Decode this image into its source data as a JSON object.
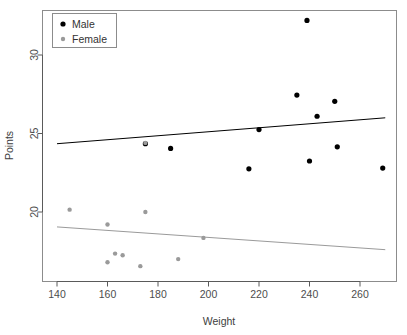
{
  "chart_data": {
    "type": "scatter",
    "title": "",
    "xlabel": "Weight",
    "ylabel": "Points",
    "xlim": [
      138,
      272
    ],
    "ylim": [
      16.1,
      32.6
    ],
    "xticks": [
      140,
      160,
      180,
      200,
      220,
      240,
      260
    ],
    "yticks": [
      20,
      25,
      30
    ],
    "grid": false,
    "legend_position": "top-left",
    "series": [
      {
        "name": "Male",
        "color": "#000000",
        "marker": "filled-circle",
        "points": [
          {
            "x": 175,
            "y": 24.35
          },
          {
            "x": 185,
            "y": 24.05
          },
          {
            "x": 216,
            "y": 22.75
          },
          {
            "x": 220,
            "y": 25.25
          },
          {
            "x": 235,
            "y": 27.45
          },
          {
            "x": 239,
            "y": 32.2
          },
          {
            "x": 240,
            "y": 23.25
          },
          {
            "x": 243,
            "y": 26.1
          },
          {
            "x": 250,
            "y": 27.05
          },
          {
            "x": 251,
            "y": 24.15
          },
          {
            "x": 269,
            "y": 22.8
          }
        ],
        "fit_line": {
          "x1": 140,
          "y1": 24.35,
          "x2": 270,
          "y2": 26.0
        }
      },
      {
        "name": "Female",
        "color": "#9a9a9a",
        "marker": "filled-circle",
        "points": [
          {
            "x": 145,
            "y": 20.15
          },
          {
            "x": 160,
            "y": 19.2
          },
          {
            "x": 160,
            "y": 16.8
          },
          {
            "x": 163,
            "y": 17.35
          },
          {
            "x": 166,
            "y": 17.25
          },
          {
            "x": 173,
            "y": 16.55
          },
          {
            "x": 175,
            "y": 24.4
          },
          {
            "x": 175,
            "y": 20.0
          },
          {
            "x": 188,
            "y": 17.0
          },
          {
            "x": 198,
            "y": 18.35
          }
        ],
        "fit_line": {
          "x1": 140,
          "y1": 19.05,
          "x2": 270,
          "y2": 17.6
        }
      }
    ]
  },
  "legend": {
    "entries": [
      {
        "label": "Male",
        "color": "#000000"
      },
      {
        "label": "Female",
        "color": "#9a9a9a"
      }
    ]
  },
  "axes": {
    "x_title": "Weight",
    "y_title": "Points",
    "x_tick_labels": [
      "140",
      "160",
      "180",
      "200",
      "220",
      "240",
      "260"
    ],
    "y_tick_labels": [
      "20",
      "25",
      "30"
    ]
  }
}
